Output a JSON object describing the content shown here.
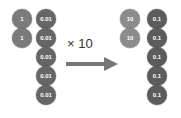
{
  "before": {
    "ones": {
      "label": "1",
      "count": 2,
      "color": "#7b7b7b"
    },
    "hundredths": {
      "label": "0.01",
      "count": 5,
      "color": "#666666"
    }
  },
  "operation": {
    "label": "× 10",
    "arrow_color": "#777777"
  },
  "after": {
    "tens": {
      "label": "10",
      "count": 2,
      "color": "#8c8c8c"
    },
    "tenths": {
      "label": "0.1",
      "count": 5,
      "color": "#5c5c5c"
    }
  }
}
